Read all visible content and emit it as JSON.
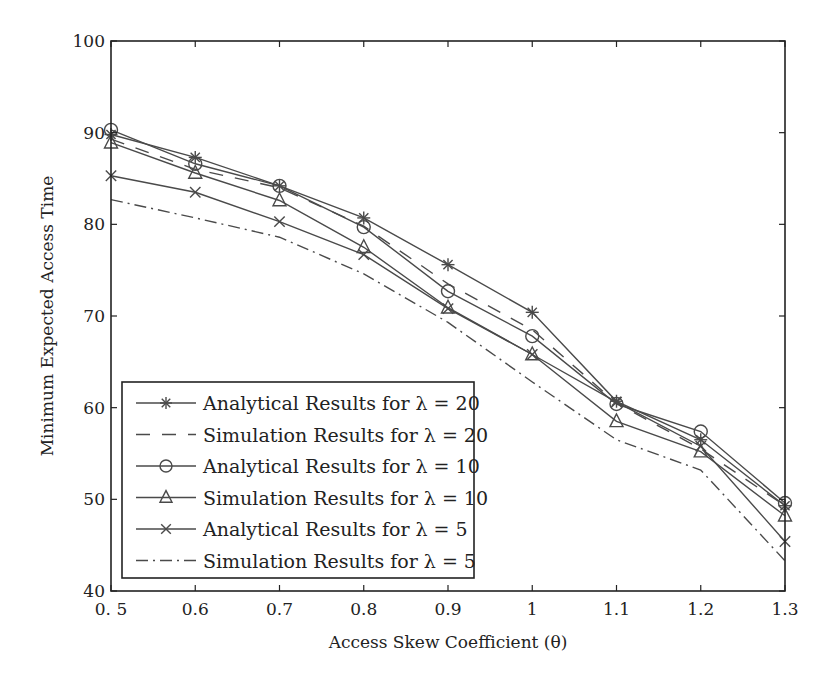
{
  "chart_data": {
    "type": "line",
    "title": "",
    "xlabel": "Access Skew Coefficient (θ)",
    "ylabel": "Minimum Expected Access Time",
    "x": [
      0.5,
      0.6,
      0.7,
      0.8,
      0.9,
      1.0,
      1.1,
      1.2,
      1.3
    ],
    "x_tick_labels": [
      "0. 5",
      "0.6",
      "0.7",
      "0.8",
      "0.9",
      "1",
      "1.1",
      "1.2",
      "1.3"
    ],
    "y_ticks": [
      40,
      50,
      60,
      70,
      80,
      90,
      100
    ],
    "y_tick_labels": [
      "40",
      "50",
      "60",
      "70",
      "80",
      "90",
      "100"
    ],
    "xlim": [
      0.5,
      1.3
    ],
    "ylim": [
      40,
      100
    ],
    "grid": false,
    "legend_position": "lower left",
    "series": [
      {
        "name": "Analytical Results for λ = 20",
        "marker": "asterisk",
        "line": "solid",
        "values": [
          89.8,
          87.3,
          84.2,
          80.7,
          75.6,
          70.4,
          60.7,
          56.5,
          49.3
        ]
      },
      {
        "name": "Simulation Results for λ = 20",
        "marker": "none",
        "line": "dashed",
        "values": [
          89.3,
          86.0,
          84.0,
          79.8,
          73.5,
          68.5,
          60.5,
          55.5,
          49.3
        ]
      },
      {
        "name": "Analytical Results for λ = 10",
        "marker": "circle",
        "line": "solid",
        "values": [
          90.3,
          86.6,
          84.2,
          79.7,
          72.7,
          67.8,
          60.4,
          57.4,
          49.6
        ]
      },
      {
        "name": "Simulation Results for λ = 10",
        "marker": "triangle",
        "line": "solid",
        "values": [
          88.9,
          85.6,
          82.6,
          77.5,
          70.9,
          65.8,
          58.5,
          55.2,
          48.2
        ]
      },
      {
        "name": "Analytical Results for λ = 5",
        "marker": "x",
        "line": "solid",
        "values": [
          85.3,
          83.5,
          80.3,
          76.7,
          70.8,
          65.8,
          60.6,
          55.8,
          45.4
        ]
      },
      {
        "name": "Simulation Results for λ = 5",
        "marker": "none",
        "line": "dashdot",
        "values": [
          82.7,
          80.7,
          78.6,
          74.6,
          69.3,
          62.8,
          56.5,
          53.2,
          43.3
        ]
      }
    ]
  },
  "colors": {
    "line": "#4a4a4a",
    "axis": "#222222",
    "background": "#ffffff"
  }
}
